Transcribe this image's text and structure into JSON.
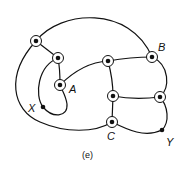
{
  "caption": "(e)",
  "colors": {
    "stroke": "#111111",
    "background": "#ffffff"
  },
  "labels": {
    "A": "A",
    "B": "B",
    "C": "C",
    "X": "X",
    "Y": "Y"
  },
  "nodes": [
    {
      "id": "n1",
      "type": "ringed",
      "x": 36,
      "y": 41
    },
    {
      "id": "n2",
      "type": "ringed",
      "x": 58,
      "y": 58
    },
    {
      "id": "A",
      "type": "ringed",
      "x": 60,
      "y": 85,
      "label": "A"
    },
    {
      "id": "X",
      "type": "dot",
      "x": 43,
      "y": 107,
      "label": "X"
    },
    {
      "id": "n3",
      "type": "ringed",
      "x": 108,
      "y": 61
    },
    {
      "id": "B",
      "type": "ringed",
      "x": 152,
      "y": 57,
      "label": "B"
    },
    {
      "id": "n4",
      "type": "ringed",
      "x": 113,
      "y": 96
    },
    {
      "id": "n5",
      "type": "ringed",
      "x": 160,
      "y": 97
    },
    {
      "id": "C",
      "type": "ringed",
      "x": 112,
      "y": 122,
      "label": "C"
    },
    {
      "id": "Y",
      "type": "dot",
      "x": 162,
      "y": 130,
      "label": "Y"
    }
  ]
}
